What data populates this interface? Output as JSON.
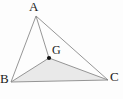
{
  "figure": {
    "kind": "geometry-diagram",
    "background_color": "#fdfdfd",
    "stroke_color": "#8a8a8a",
    "fill_color": "#e9e9e9",
    "point_color": "#111111",
    "label_color": "#1a1a1a",
    "canvas": {
      "width": 123,
      "height": 99
    },
    "points": [
      {
        "id": "A",
        "label": "A",
        "x": 36,
        "y": 16,
        "marker": false
      },
      {
        "id": "B",
        "label": "B",
        "x": 11,
        "y": 82,
        "marker": false
      },
      {
        "id": "C",
        "label": "C",
        "x": 108,
        "y": 80,
        "marker": false
      },
      {
        "id": "G",
        "label": "G",
        "x": 49,
        "y": 58,
        "marker": true
      }
    ],
    "segments": [
      {
        "from": "A",
        "to": "B"
      },
      {
        "from": "A",
        "to": "C"
      },
      {
        "from": "B",
        "to": "C"
      },
      {
        "from": "A",
        "to": "G"
      },
      {
        "from": "B",
        "to": "G"
      },
      {
        "from": "G",
        "to": "C"
      }
    ],
    "shaded_region": {
      "name": "triangle-BGC",
      "vertices": [
        "B",
        "G",
        "C"
      ],
      "polygon": "11,82 49,58 108,80"
    },
    "labels": {
      "A": "A",
      "B": "B",
      "C": "C",
      "G": "G"
    }
  }
}
